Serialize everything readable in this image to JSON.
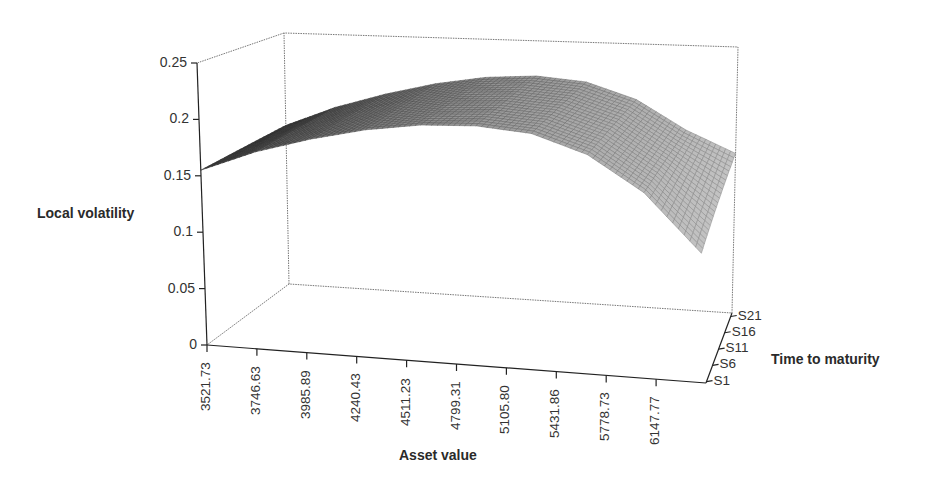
{
  "chart_data": {
    "type": "surface3d",
    "title": "",
    "xlabel": "Asset value",
    "ylabel": "Time to maturity",
    "zlabel": "Local volatility",
    "x_ticks": [
      "3521.73",
      "3746.63",
      "3985.89",
      "4240.43",
      "4511.23",
      "4799.31",
      "5105.80",
      "5431.86",
      "5778.73",
      "6147.77"
    ],
    "y_ticks": [
      "S1",
      "S6",
      "S11",
      "S16",
      "S21"
    ],
    "z_ticks": [
      "0",
      "0.05",
      "0.1",
      "0.15",
      "0.2",
      "0.25"
    ],
    "zlim": [
      0,
      0.25
    ],
    "grid": false,
    "legend": "none",
    "surface_profile": {
      "description": "Local volatility surface, nearly constant across time to maturity; rises from ~0.155 at low asset value to a peak ~0.22 around 4800-5100, then falls to ~0.11 at highest asset value with slight upturn at the far end",
      "x": [
        3521.73,
        3746.63,
        3985.89,
        4240.43,
        4511.23,
        4799.31,
        5105.8,
        5431.86,
        5778.73,
        6147.77
      ],
      "z_front": [
        0.155,
        0.175,
        0.19,
        0.202,
        0.21,
        0.213,
        0.21,
        0.195,
        0.165,
        0.115
      ],
      "z_back": [
        0.158,
        0.178,
        0.193,
        0.205,
        0.213,
        0.216,
        0.212,
        0.197,
        0.17,
        0.15
      ]
    }
  },
  "labels": {
    "zlabel": "Local volatility",
    "xlabel": "Asset value",
    "ylabel": "Time to maturity"
  }
}
